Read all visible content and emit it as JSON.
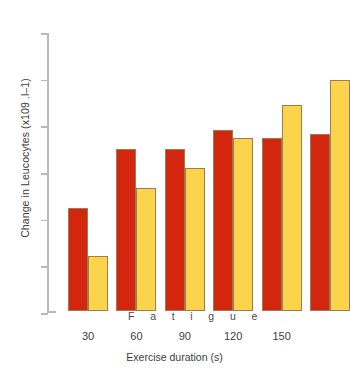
{
  "chart_data": {
    "type": "bar",
    "title": "",
    "xlabel": "Exercise duration (s)",
    "ylabel": "Change in Leucocytes (x109 .l–1)",
    "categories": [
      "30",
      "60",
      "90",
      "120",
      "150",
      ""
    ],
    "series": [
      {
        "name": "series-red",
        "color": "#d2260f",
        "values": [
          2.2,
          3.48,
          3.47,
          3.87,
          3.7,
          3.8
        ]
      },
      {
        "name": "series-yellow",
        "color": "#fbd44b",
        "values": [
          1.17,
          2.63,
          3.07,
          3.7,
          4.42,
          4.95
        ]
      }
    ],
    "ylim": [
      0,
      6
    ],
    "yticks": [
      0,
      1,
      2,
      3,
      4,
      5,
      6
    ],
    "ytick_labels": [
      "0",
      "1",
      "2",
      "3",
      "4",
      "5",
      "6"
    ],
    "grid": false,
    "legend": "none",
    "annotations": [
      {
        "name": "fatigue-annotation",
        "text": "Fatigue",
        "spaced_text": "F a t i g u e"
      }
    ]
  },
  "axes": {
    "y_title": "Change in Leucocytes (x109 .l–1)",
    "x_title": "Exercise duration (s)",
    "y_ticks": [
      "6",
      "5",
      "4",
      "3",
      "2",
      "1",
      "0"
    ],
    "x_ticks": [
      "30",
      "60",
      "90",
      "120",
      "150"
    ]
  },
  "annotation": {
    "fatigue": "F a t i g u e"
  },
  "colors": {
    "bar_red": "#d2260f",
    "bar_yellow": "#fbd44b",
    "bar_outline": "#9a7d52",
    "axis": "#b9b9b9",
    "text": "#3c3c3c",
    "background": "#ffffff"
  }
}
